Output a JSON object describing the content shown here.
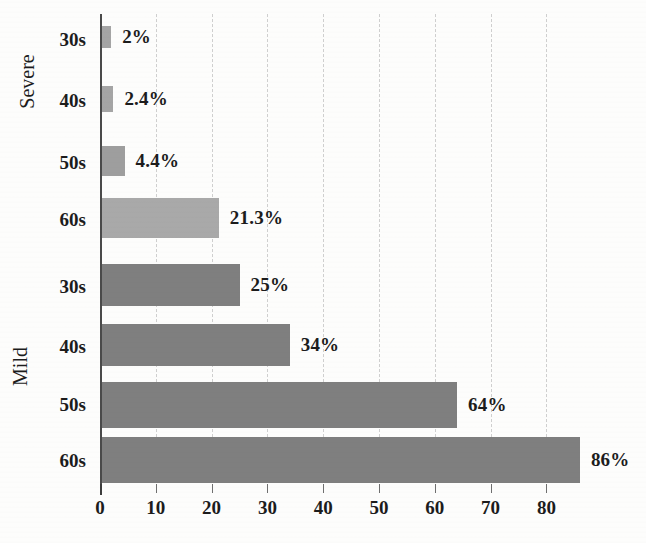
{
  "chart_data": {
    "type": "bar",
    "orientation": "horizontal",
    "title": "",
    "subtitle": "",
    "xlabel": "",
    "ylabel": "",
    "xlim": [
      0,
      93
    ],
    "grid": true,
    "grid_axis": "x",
    "grid_style": "dashed",
    "legend": false,
    "legend_position": "none",
    "xticks": [
      0,
      10,
      20,
      30,
      40,
      50,
      60,
      70,
      80
    ],
    "xtick_labels": [
      "0",
      "10",
      "20",
      "30",
      "40",
      "50",
      "60",
      "70",
      "80"
    ],
    "groups": [
      {
        "name": "Severe",
        "categories": [
          "30s",
          "40s",
          "50s",
          "60s"
        ],
        "values": [
          2,
          2.4,
          4.4,
          21.3
        ],
        "data_labels": [
          "2%",
          "2.4%",
          "4.4%",
          "21.3%"
        ],
        "bar_colors": [
          "#a5a5a5",
          "#a5a5a5",
          "#9e9e9e",
          "#a9a9a9"
        ]
      },
      {
        "name": "Mild",
        "categories": [
          "30s",
          "40s",
          "50s",
          "60s"
        ],
        "values": [
          25,
          34,
          64,
          86
        ],
        "data_labels": [
          "25%",
          "34%",
          "64%",
          "86%"
        ],
        "bar_colors": [
          "#7f7f7f",
          "#7f7f7f",
          "#7f7f7f",
          "#7f7f7f"
        ]
      }
    ],
    "colors": {
      "severe_bar": "#a5a5a5",
      "mild_bar": "#7f7f7f",
      "axis": "#4a4a4a",
      "gridline": "#cfcfcf",
      "text": "#1c1c1c",
      "background": "#fdfdfc"
    }
  },
  "bars": [
    {
      "group": "Severe",
      "category": "30s",
      "value": 2,
      "label": "2%"
    },
    {
      "group": "Severe",
      "category": "40s",
      "value": 2.4,
      "label": "2.4%"
    },
    {
      "group": "Severe",
      "category": "50s",
      "value": 4.4,
      "label": "4.4%"
    },
    {
      "group": "Severe",
      "category": "60s",
      "value": 21.3,
      "label": "21.3%"
    },
    {
      "group": "Mild",
      "category": "30s",
      "value": 25,
      "label": "25%"
    },
    {
      "group": "Mild",
      "category": "40s",
      "value": 34,
      "label": "34%"
    },
    {
      "group": "Mild",
      "category": "50s",
      "value": 64,
      "label": "64%"
    },
    {
      "group": "Mild",
      "category": "60s",
      "value": 86,
      "label": "86%"
    }
  ],
  "axis": {
    "group_labels": [
      "Severe",
      "Mild"
    ],
    "category_labels": [
      "30s",
      "40s",
      "50s",
      "60s",
      "30s",
      "40s",
      "50s",
      "60s"
    ],
    "xtick_labels": [
      "0",
      "10",
      "20",
      "30",
      "40",
      "50",
      "60",
      "70",
      "80"
    ]
  }
}
